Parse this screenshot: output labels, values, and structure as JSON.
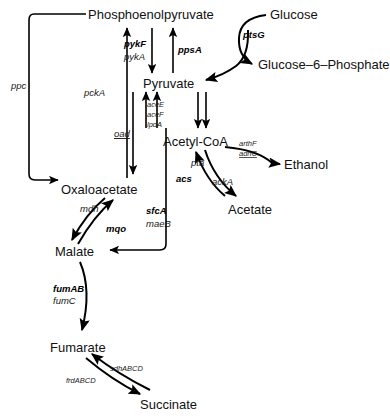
{
  "figure": {
    "background_color": "#ffffff",
    "line_color": "#000000",
    "text_color": "#111111",
    "width": 390,
    "height": 416
  },
  "metabolites": {
    "pep": "Phosphoenolpyruvate",
    "glucose": "Glucose",
    "g6p": "Glucose–6–Phosphate",
    "pyruvate": "Pyruvate",
    "acetyl_coa": "Acetyl-CoA",
    "ethanol": "Ethanol",
    "acetate": "Acetate",
    "oxaloacetate": "Oxaloacetate",
    "malate": "Malate",
    "fumarate": "Fumarate",
    "succinate": "Succinate"
  },
  "genes": {
    "ptsG": "ptsG",
    "pykF": "pykF",
    "pykA": "pykA",
    "ppsA": "ppsA",
    "ppc": "ppc",
    "pckA": "pckA",
    "oad": "oad",
    "aceE": "aceE",
    "aceF": "aceF",
    "lpdA": "lpdA",
    "pta": "pta",
    "ackA": "ackA",
    "acs": "acs",
    "arthF": "arthF",
    "adhC": "adhC",
    "mdh": "mdh",
    "mqo": "mqo",
    "sfcA": "sfcA",
    "maeB": "maeB",
    "fumAB": "fumAB",
    "fumC": "fumC",
    "sdhABCD": "sdhABCD",
    "frdABCD": "frdABCD"
  },
  "reactions": [
    {
      "id": "glucose-uptake",
      "from": "Glucose",
      "to": "Glucose–6–Phosphate",
      "enzymes": [
        "ptsG"
      ]
    },
    {
      "id": "pts-pep-pyruvate",
      "from": "Phosphoenolpyruvate",
      "to": "Pyruvate",
      "enzymes": [
        "ptsG"
      ]
    },
    {
      "id": "pyruvate-kinase",
      "from": "Phosphoenolpyruvate",
      "to": "Pyruvate",
      "enzymes": [
        "pykF",
        "pykA"
      ]
    },
    {
      "id": "pep-synthase",
      "from": "Pyruvate",
      "to": "Phosphoenolpyruvate",
      "enzymes": [
        "ppsA"
      ]
    },
    {
      "id": "pep-carboxylase",
      "from": "Phosphoenolpyruvate",
      "to": "Oxaloacetate",
      "enzymes": [
        "ppc"
      ]
    },
    {
      "id": "pep-carboxykinase",
      "from": "Oxaloacetate",
      "to": "Phosphoenolpyruvate",
      "enzymes": [
        "pckA"
      ]
    },
    {
      "id": "oxaloacetate-decarboxylase",
      "from": "Pyruvate",
      "to": "Oxaloacetate",
      "enzymes": [
        "oad"
      ]
    },
    {
      "id": "pyruvate-dehydrogenase",
      "from": "Pyruvate",
      "to": "Acetyl-CoA",
      "enzymes": [
        "aceE",
        "aceF",
        "lpdA"
      ]
    },
    {
      "id": "acetyl-coa-to-acetate",
      "from": "Acetyl-CoA",
      "to": "Acetate",
      "enzymes": [
        "pta",
        "ackA"
      ]
    },
    {
      "id": "acetate-to-acetyl-coa",
      "from": "Acetate",
      "to": "Acetyl-CoA",
      "enzymes": [
        "acs"
      ]
    },
    {
      "id": "acetyl-coa-to-ethanol",
      "from": "Acetyl-CoA",
      "to": "Ethanol",
      "enzymes": [
        "arthF",
        "adhC"
      ]
    },
    {
      "id": "malate-dehydrogenase",
      "from": "Oxaloacetate",
      "to": "Malate",
      "enzymes": [
        "mdh"
      ]
    },
    {
      "id": "malate-quinone-oxidoreductase",
      "from": "Malate",
      "to": "Oxaloacetate",
      "enzymes": [
        "mqo"
      ]
    },
    {
      "id": "malic-enzyme",
      "from": "Acetyl-CoA",
      "to": "Malate",
      "enzymes": [
        "sfcA",
        "maeB"
      ]
    },
    {
      "id": "fumarase",
      "from": "Malate",
      "to": "Fumarate",
      "enzymes": [
        "fumAB",
        "fumC"
      ]
    },
    {
      "id": "succinate-dehydrogenase",
      "from": "Succinate",
      "to": "Fumarate",
      "enzymes": [
        "sdhABCD"
      ]
    },
    {
      "id": "fumarate-reductase",
      "from": "Fumarate",
      "to": "Succinate",
      "enzymes": [
        "frdABCD"
      ]
    }
  ]
}
